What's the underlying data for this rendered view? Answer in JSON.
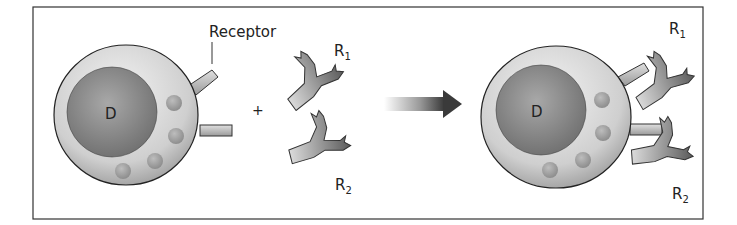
{
  "diagram": {
    "labels": {
      "receptor": "Receptor",
      "drug_left": "D",
      "drug_right": "D",
      "plus": "+",
      "r1_free": "R",
      "r1_free_sub": "1",
      "r2_free": "R",
      "r2_free_sub": "2",
      "r1_bound": "R",
      "r1_bound_sub": "1",
      "r2_bound": "R",
      "r2_bound_sub": "2"
    },
    "colors": {
      "frame": "#333333",
      "cell_fill": "#d9d9d9",
      "nucleus_fill": "#8c8c8c",
      "antibody_dark": "#555555",
      "antibody_light": "#cfcfcf",
      "arrow": "#444444"
    }
  }
}
